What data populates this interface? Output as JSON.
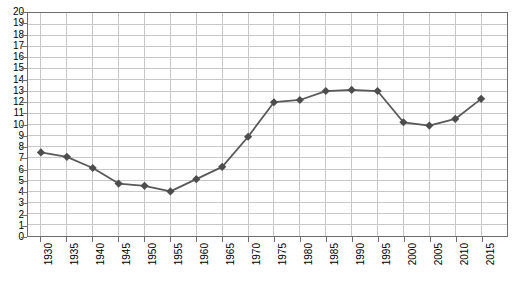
{
  "chart_data": {
    "type": "line",
    "title": "",
    "subtitle": "",
    "xlabel": "",
    "ylabel": "",
    "xlim": [
      1927.5,
      2020.0
    ],
    "ylim": [
      0,
      20
    ],
    "grid": true,
    "legend": false,
    "legend_position": "none",
    "y_tick_step": 1,
    "x_tick_step": 5,
    "marker": "diamond",
    "line_color": "#595959",
    "marker_color": "#4d4d4d",
    "grid_color": "#c8c8c8",
    "frame_color": "#6f6f6f",
    "background_color": "#ffffff",
    "categories": [
      "1930",
      "1935",
      "1940",
      "1945",
      "1950",
      "1955",
      "1960",
      "1965",
      "1970",
      "1975",
      "1980",
      "1985",
      "1990",
      "1995",
      "2000",
      "2005",
      "2010",
      "2015"
    ],
    "x": [
      1930,
      1935,
      1940,
      1945,
      1950,
      1955,
      1960,
      1965,
      1970,
      1975,
      1980,
      1985,
      1990,
      1995,
      2000,
      2005,
      2010,
      2015
    ],
    "values": [
      7.5,
      7.1,
      6.1,
      4.7,
      4.5,
      4.0,
      5.1,
      6.2,
      8.9,
      12.0,
      12.2,
      13.0,
      13.1,
      13.0,
      10.2,
      9.9,
      10.5,
      12.3
    ],
    "y_tick_labels": [
      "20",
      "19",
      "18",
      "17",
      "16",
      "15",
      "14",
      "13",
      "12",
      "11",
      "10",
      "9",
      "8",
      "7",
      "6",
      "5",
      "4",
      "3",
      "2",
      "1",
      "0"
    ],
    "x_tick_labels": [
      "1930",
      "1935",
      "1940",
      "1945",
      "1950",
      "1955",
      "1960",
      "1965",
      "1970",
      "1975",
      "1980",
      "1985",
      "1990",
      "1995",
      "2000",
      "2005",
      "2010",
      "2015"
    ]
  }
}
